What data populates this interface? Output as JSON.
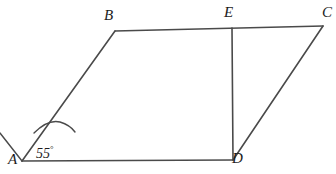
{
  "figure": {
    "background_color": "#ffffff",
    "stroke_color": "#4a4a4a",
    "label_color": "#1c1c1c",
    "width": 336,
    "height": 174,
    "points": {
      "A": {
        "label": "A",
        "x": 22,
        "y": 161
      },
      "B": {
        "label": "B",
        "x": 115,
        "y": 31
      },
      "C": {
        "label": "C",
        "x": 323,
        "y": 26
      },
      "D": {
        "label": "D",
        "x": 233,
        "y": 160
      },
      "E": {
        "label": "E",
        "x": 232,
        "y": 28
      }
    },
    "segments": [
      {
        "name": "side-AB",
        "from": "A",
        "to": "B"
      },
      {
        "name": "side-BC",
        "from": "B",
        "to": "C"
      },
      {
        "name": "side-CD",
        "from": "C",
        "to": "D"
      },
      {
        "name": "side-DA",
        "from": "D",
        "to": "A"
      },
      {
        "name": "segment-ED",
        "from": "E",
        "to": "D"
      }
    ],
    "rays": [
      {
        "name": "ray-from-A-upper-left",
        "from_x": 22,
        "from_y": 161,
        "to_x": 0,
        "to_y": 133
      }
    ],
    "angle_marks": [
      {
        "name": "angle-A",
        "at_vertex": "A",
        "value": "55",
        "degree_symbol": "°",
        "label": "55°",
        "label_x": 36,
        "label_y": 145
      }
    ],
    "labels": {
      "A": {
        "text": "A",
        "x": 8,
        "y": 152
      },
      "B": {
        "text": "B",
        "x": 104,
        "y": 8
      },
      "C": {
        "text": "C",
        "x": 322,
        "y": 5
      },
      "D": {
        "text": "D",
        "x": 232,
        "y": 151
      },
      "E": {
        "text": "E",
        "x": 224,
        "y": 5
      }
    }
  }
}
